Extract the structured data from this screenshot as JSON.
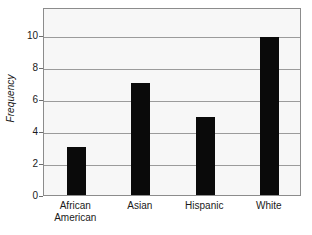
{
  "chart_data": {
    "type": "bar",
    "title": "",
    "xlabel": "",
    "ylabel": "Frequency",
    "categories": [
      "African American",
      "Asian",
      "Hispanic",
      "White"
    ],
    "category_lines": [
      [
        "African",
        "American"
      ],
      [
        "Asian"
      ],
      [
        "Hispanic"
      ],
      [
        "White"
      ]
    ],
    "values": [
      3,
      7,
      4.9,
      9.9
    ],
    "ylim": [
      0,
      11.75
    ],
    "yticks": [
      0,
      2,
      4,
      6,
      8,
      10
    ],
    "ytick_labels": [
      "0",
      "2",
      "4",
      "6",
      "8",
      "10"
    ],
    "grid": "horizontal",
    "legend": "none",
    "bar_color": "#0a0a0a",
    "plot_background": "#f7f7f7",
    "gridline_color": "#9b9b9b",
    "axis_color": "#8c8c8c",
    "text_color": "#1a1a1a"
  }
}
